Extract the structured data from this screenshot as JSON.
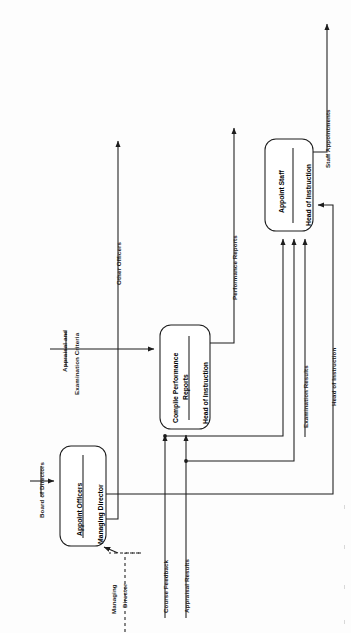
{
  "diagram": {
    "type": "data-flow-diagram",
    "orientation": "rotated-90-ccw",
    "processes": [
      {
        "id": "p1",
        "name": "Appoint Officers",
        "actor": "Managing Director"
      },
      {
        "id": "p2",
        "name": "Compile Performance Reports",
        "actor": "Head of Instruction"
      },
      {
        "id": "p3",
        "name": "Appoint Staff",
        "actor": "Head of Instruction"
      }
    ],
    "entities": [
      {
        "id": "e1",
        "name": "Board of Directors"
      },
      {
        "id": "e2",
        "name": "Managing Director",
        "line1": "Managing",
        "line2": "Director",
        "style": "dashed"
      }
    ],
    "flows": [
      {
        "label": "Board of Directors",
        "from": "e1",
        "to": "p1"
      },
      {
        "label": "Other Officers",
        "from": "p1",
        "to": "out"
      },
      {
        "label": "Appraisal and Examination Criteria",
        "line1": "Appraisal and",
        "line2": "Examination Criteria",
        "from": "in",
        "to": "p2"
      },
      {
        "label": "Performance Reports",
        "from": "p2",
        "to": "out"
      },
      {
        "label": "Course Feedback",
        "from": "in",
        "to": "p2"
      },
      {
        "label": "Appraisal Results",
        "from": "in",
        "to": "p2"
      },
      {
        "label": "Examination Results",
        "from": "in",
        "to": "p3"
      },
      {
        "label": "Head of Instruction",
        "from": "p1",
        "to": "p3"
      },
      {
        "label": "Staff Appointments",
        "from": "p3",
        "to": "out"
      }
    ],
    "process_names": {
      "p1_name": "Appoint Officers",
      "p1_actor": "Managing Director",
      "p2_name_l1": "Compile Performance",
      "p2_name_l2": "Reports",
      "p2_actor": "Head of Instruction",
      "p3_name": "Appoint Staff",
      "p3_actor": "Head of Instruction"
    },
    "flow_labels": {
      "board_of_directors": "Board of Directors",
      "other_officers": "Other Officers",
      "appraisal_criteria_l1": "Appraisal and",
      "appraisal_criteria_l2": "Examination Criteria",
      "performance_reports": "Performance Reports",
      "course_feedback": "Course Feedback",
      "appraisal_results": "Appraisal Results",
      "examination_results": "Examination Results",
      "head_of_instruction": "Head of Instruction",
      "staff_appointments": "Staff Appointments",
      "managing_director_l1": "Managing",
      "managing_director_l2": "Director"
    },
    "colors": {
      "line": "#1c1c1c",
      "text": "#000000",
      "bg": "#fdfdfd"
    }
  }
}
